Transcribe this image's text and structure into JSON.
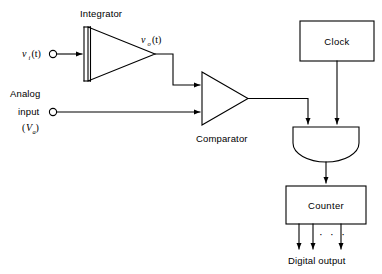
{
  "diagram": {
    "blocks": {
      "integrator": {
        "label": "Integrator",
        "type": "triangle-with-bar"
      },
      "comparator": {
        "label": "Comparator",
        "type": "triangle"
      },
      "clock": {
        "label": "Clock",
        "type": "rectangle"
      },
      "and_gate": {
        "label": "",
        "type": "and-gate"
      },
      "counter": {
        "label": "Counter",
        "type": "rectangle"
      }
    },
    "signals": {
      "input_voltage": {
        "base": "v",
        "subscript": "i",
        "arg": "(t)"
      },
      "integrator_output": {
        "base": "v",
        "subscript": "o",
        "arg": "(t)"
      },
      "analog_input": {
        "line1": "Analog",
        "line2": "input",
        "line3_open": "(",
        "line3_base": "V",
        "line3_sub": "a",
        "line3_close": ")"
      },
      "digital_output": {
        "label": "Digital output",
        "ellipsis": "· · ·",
        "bit_count": 3
      }
    },
    "colors": {
      "line": "#000000",
      "fill": "#ffffff",
      "text": "#000000"
    }
  }
}
